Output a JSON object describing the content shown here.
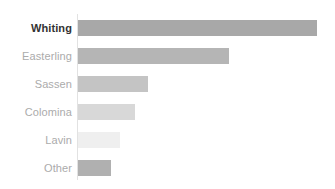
{
  "chart_data": {
    "type": "bar",
    "orientation": "horizontal",
    "title": "",
    "subtitle": "",
    "xlabel": "",
    "ylabel": "",
    "categories": [
      "Whiting",
      "Easterling",
      "Sassen",
      "Colomina",
      "Lavin",
      "Other"
    ],
    "values": [
      100.0,
      63.2,
      29.3,
      23.8,
      17.6,
      13.8
    ],
    "xlim": [
      0,
      100
    ],
    "grid": false,
    "legend": null,
    "tick_labels": {
      "x": [],
      "y": [
        "Whiting",
        "Easterling",
        "Sassen",
        "Colomina",
        "Lavin",
        "Other"
      ]
    },
    "annotations": [],
    "series": [
      {
        "name": "",
        "values": [
          100.0,
          63.2,
          29.3,
          23.8,
          17.6,
          13.8
        ]
      }
    ],
    "bar_colors": [
      "#a8a8a8",
      "#b5b5b5",
      "#c4c4c4",
      "#d8d8d8",
      "#efefef",
      "#b0b0b0"
    ],
    "highlighted_category": "Whiting"
  },
  "style": {
    "background": "#ffffff",
    "axis_color": "#e2e2e2",
    "label_color": "#ababab",
    "highlight_label_color": "#333333"
  },
  "bars": [
    {
      "label": "Whiting",
      "value": 100.0,
      "pixel_length": 239,
      "color": "#a8a8a8",
      "highlighted": true
    },
    {
      "label": "Easterling",
      "value": 63.2,
      "pixel_length": 151,
      "color": "#b5b5b5",
      "highlighted": false
    },
    {
      "label": "Sassen",
      "value": 29.3,
      "pixel_length": 70,
      "color": "#c4c4c4",
      "highlighted": false
    },
    {
      "label": "Colomina",
      "value": 23.8,
      "pixel_length": 57,
      "color": "#d8d8d8",
      "highlighted": false
    },
    {
      "label": "Lavin",
      "value": 17.6,
      "pixel_length": 42,
      "color": "#efefef",
      "highlighted": false
    },
    {
      "label": "Other",
      "value": 13.8,
      "pixel_length": 33,
      "color": "#b0b0b0",
      "highlighted": false
    }
  ]
}
